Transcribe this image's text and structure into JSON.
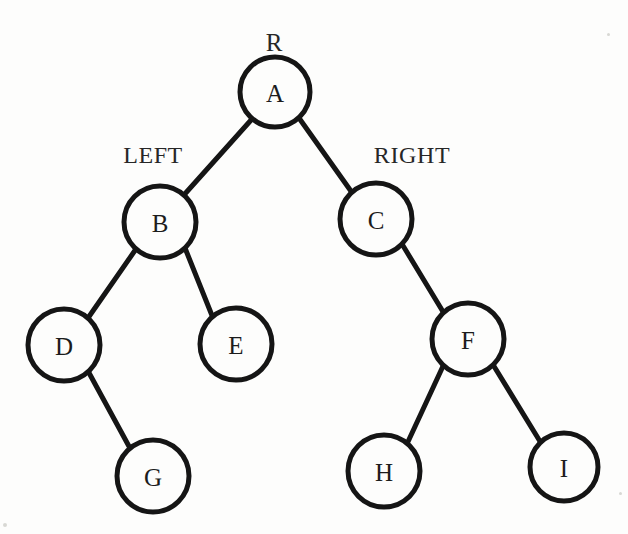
{
  "figure": {
    "type": "binary-tree",
    "width": 628,
    "height": 534,
    "background_color": "#fdfdfc",
    "stroke_color": "#151515",
    "node_fill_color": "#fdfdfc",
    "label_color": "#1c1c1c"
  },
  "annotations": [
    {
      "id": "root-marker",
      "text": "R",
      "x": 274,
      "y": 42
    },
    {
      "id": "left-marker",
      "text": "LEFT",
      "x": 153,
      "y": 155
    },
    {
      "id": "right-marker",
      "text": "RIGHT",
      "x": 412,
      "y": 155
    }
  ],
  "nodes": [
    {
      "id": "A",
      "label": "A",
      "cx": 275,
      "cy": 92,
      "r": 35
    },
    {
      "id": "B",
      "label": "B",
      "cx": 160,
      "cy": 222,
      "r": 36
    },
    {
      "id": "C",
      "label": "C",
      "cx": 376,
      "cy": 219,
      "r": 36
    },
    {
      "id": "D",
      "label": "D",
      "cx": 64,
      "cy": 345,
      "r": 36
    },
    {
      "id": "E",
      "label": "E",
      "cx": 236,
      "cy": 344,
      "r": 36
    },
    {
      "id": "F",
      "label": "F",
      "cx": 468,
      "cy": 339,
      "r": 36
    },
    {
      "id": "G",
      "label": "G",
      "cx": 153,
      "cy": 476,
      "r": 36
    },
    {
      "id": "H",
      "label": "H",
      "cx": 384,
      "cy": 471,
      "r": 36
    },
    {
      "id": "I",
      "label": "I",
      "cx": 564,
      "cy": 467,
      "r": 34
    }
  ],
  "edges": [
    {
      "id": "A-B",
      "from": "A",
      "to": "B",
      "side": "left",
      "x1": 252,
      "y1": 119,
      "x2": 183,
      "y2": 196
    },
    {
      "id": "A-C",
      "from": "A",
      "to": "C",
      "side": "right",
      "x1": 299,
      "y1": 118,
      "x2": 353,
      "y2": 194
    },
    {
      "id": "B-D",
      "from": "B",
      "to": "D",
      "side": "left",
      "x1": 136,
      "y1": 249,
      "x2": 88,
      "y2": 318
    },
    {
      "id": "B-E",
      "from": "B",
      "to": "E",
      "side": "right",
      "x1": 185,
      "y1": 248,
      "x2": 213,
      "y2": 318
    },
    {
      "id": "C-F",
      "from": "C",
      "to": "F",
      "side": "right",
      "x1": 402,
      "y1": 244,
      "x2": 445,
      "y2": 315
    },
    {
      "id": "D-G",
      "from": "D",
      "to": "G",
      "side": "right",
      "x1": 88,
      "y1": 371,
      "x2": 131,
      "y2": 450
    },
    {
      "id": "F-H",
      "from": "F",
      "to": "H",
      "side": "left",
      "x1": 444,
      "y1": 364,
      "x2": 406,
      "y2": 446
    },
    {
      "id": "F-I",
      "from": "F",
      "to": "I",
      "side": "right",
      "x1": 492,
      "y1": 363,
      "x2": 541,
      "y2": 443
    }
  ],
  "specks": [
    {
      "x": 3,
      "y": 523,
      "size": 4
    },
    {
      "x": 619,
      "y": 492,
      "size": 3
    },
    {
      "x": 607,
      "y": 33,
      "size": 3
    }
  ]
}
